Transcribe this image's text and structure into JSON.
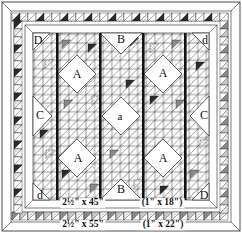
{
  "diagram": {
    "type": "quilt-assembly-diagram",
    "colors": {
      "line": "#1a1a1a",
      "background": "#ffffff",
      "dark_fabric": "#2a2a2a",
      "medium_fabric": "#8a8a8a",
      "light_print": "#c8c8c8"
    },
    "piece_labels": [
      {
        "id": "D-top-left",
        "text": "D",
        "x": 38,
        "y": 40
      },
      {
        "id": "B-top",
        "text": "B",
        "x": 121,
        "y": 39
      },
      {
        "id": "d-top-right",
        "text": "d",
        "x": 205,
        "y": 40
      },
      {
        "id": "A-top-left",
        "text": "A",
        "x": 77,
        "y": 74
      },
      {
        "id": "A-top-right",
        "text": "A",
        "x": 163,
        "y": 73
      },
      {
        "id": "C-left",
        "text": "C",
        "x": 40,
        "y": 115
      },
      {
        "id": "a-center",
        "text": "a",
        "x": 120,
        "y": 116
      },
      {
        "id": "C-right",
        "text": "C",
        "x": 204,
        "y": 115
      },
      {
        "id": "A-bottom-left",
        "text": "A",
        "x": 78,
        "y": 158
      },
      {
        "id": "A-bottom-right",
        "text": "A",
        "x": 163,
        "y": 158
      },
      {
        "id": "d-bottom-left",
        "text": "d",
        "x": 40,
        "y": 195
      },
      {
        "id": "B-bottom",
        "text": "B",
        "x": 121,
        "y": 189
      },
      {
        "id": "D-bottom-right",
        "text": "D",
        "x": 204,
        "y": 195
      }
    ],
    "dimension_labels": [
      {
        "id": "inner-border-width",
        "text": "2½\" x 45\"",
        "x": 83,
        "y": 203
      },
      {
        "id": "inner-sashing",
        "text": "(1\" x 18\")",
        "x": 162,
        "y": 203
      },
      {
        "id": "outer-border-width",
        "text": "2½\" x 55\"",
        "x": 83,
        "y": 225
      },
      {
        "id": "outer-sashing",
        "text": "(1\" x 22\")",
        "x": 163,
        "y": 225
      }
    ],
    "sashing_bars_x": [
      57,
      100,
      143,
      185
    ]
  }
}
